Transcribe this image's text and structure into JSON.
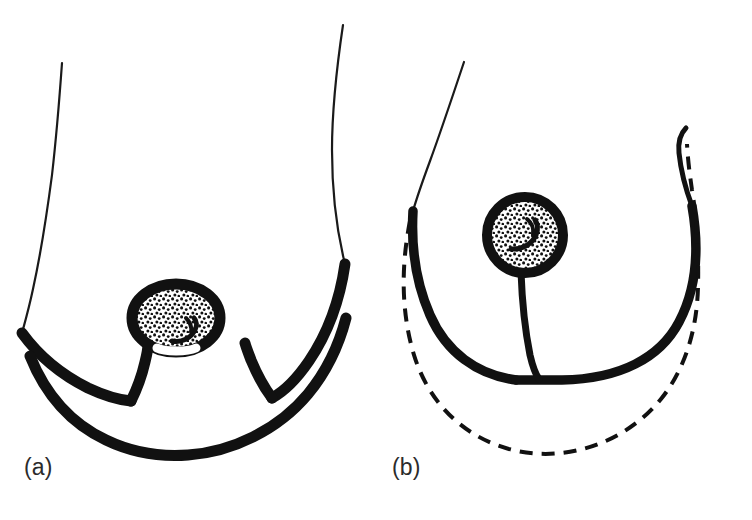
{
  "figure": {
    "background_color": "#ffffff",
    "ink_color": "#111111",
    "label_color": "#2b2b2b",
    "width": 752,
    "height": 520,
    "panels": [
      {
        "id": "a",
        "label": "(a)",
        "label_x": 24,
        "label_y": 456,
        "caption_role": "preoperative-markings",
        "description": "Ptotic breast in profile outline with thin skin contour lines; thick keyhole (Wise pattern) incision markings drawn around the areola, two vertical limbs descending from the areola, and a long curved inframammary incision line below.",
        "elements": [
          "thin-chest-contour-left",
          "thin-chest-contour-right",
          "thick-keyhole-outline",
          "areola-oval-stippled",
          "nipple-mark",
          "thick-inframammary-curve"
        ]
      },
      {
        "id": "b",
        "label": "(b)",
        "label_x": 392,
        "label_y": 456,
        "caption_role": "postoperative-result",
        "description": "Lifted, smaller breast drawn with a thick solid contour; round stippled areola raised to a higher position; a single vertical scar line running from the areola down to the inframammary fold; a dashed line outside the solid contour indicates the original preoperative breast shape.",
        "elements": [
          "thin-chest-contour-upper",
          "thick-breast-contour",
          "areola-circle-stippled",
          "nipple-mark",
          "vertical-scar-line",
          "dashed-preoperative-outline"
        ]
      }
    ],
    "line_styles": {
      "thin_contour_width": 2,
      "thick_incision_width": 11,
      "medium_width": 5,
      "dashed_width": 4,
      "dash_pattern": "13 9"
    },
    "stipple": {
      "dot_color": "#111111",
      "dot_radius": 1.7,
      "description": "fine random dot stipple filling the areola"
    }
  }
}
